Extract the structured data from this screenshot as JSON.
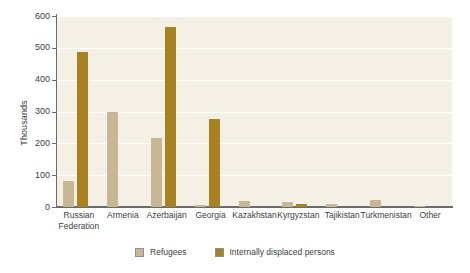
{
  "chart_data": {
    "type": "bar",
    "title": "",
    "xlabel": "",
    "ylabel": "Thousands",
    "ylim": [
      0,
      600
    ],
    "yticks": [
      0,
      100,
      200,
      300,
      400,
      500,
      600
    ],
    "ytick_labels": [
      "0",
      "100",
      "200",
      "300",
      "400",
      "500",
      "600"
    ],
    "grid": true,
    "legend_position": "bottom",
    "categories": [
      "Russian Federation",
      "Armenia",
      "Azerbaijan",
      "Georgia",
      "Kazakhstan",
      "Kyrgyzstan",
      "Tajikistan",
      "Turkmenistan",
      "Other"
    ],
    "category_lines": [
      [
        "Russian",
        "Federation"
      ],
      [
        "Armenia"
      ],
      [
        "Azerbaijan"
      ],
      [
        "Georgia"
      ],
      [
        "Kazakhstan"
      ],
      [
        "Kyrgyzstan"
      ],
      [
        "Tajikistan"
      ],
      [
        "Turkmenistan"
      ],
      [
        "Other"
      ]
    ],
    "series": [
      {
        "name": "Refugees",
        "color": "#c8b795",
        "values": [
          82,
          298,
          218,
          5,
          18,
          16,
          8,
          22,
          4
        ]
      },
      {
        "name": "Internally displaced persons",
        "color": "#a8821e",
        "values": [
          488,
          0,
          565,
          278,
          0,
          9,
          0,
          0,
          0
        ]
      }
    ]
  },
  "style": {
    "plot_background": "#f4f0e5",
    "gridline_color": "#ffffff",
    "axis_color": "#6b6b6b",
    "text_color": "#3d3d3d"
  }
}
